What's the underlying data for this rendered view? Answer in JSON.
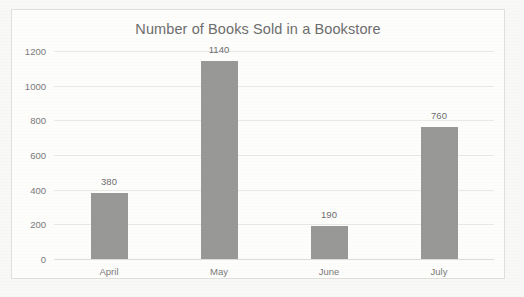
{
  "chart_data": {
    "type": "bar",
    "title": "Number of Books Sold in a Bookstore",
    "xlabel": "",
    "ylabel": "",
    "categories": [
      "April",
      "May",
      "June",
      "July"
    ],
    "values": [
      380,
      1140,
      190,
      760
    ],
    "value_labels": [
      "380",
      "1140",
      "190",
      "760"
    ],
    "ylim": [
      0,
      1200
    ],
    "yticks": [
      0,
      200,
      400,
      600,
      800,
      1000,
      1200
    ],
    "ytick_labels": [
      "0",
      "200",
      "400",
      "600",
      "800",
      "1000",
      "1200"
    ],
    "grid": true,
    "legend": false,
    "series": [
      {
        "name": "Books Sold",
        "values": [
          380,
          1140,
          190,
          760
        ],
        "color": "#989896"
      }
    ],
    "colors": {
      "bar": "#989896",
      "gridline": "#e9e9e7",
      "axis_text": "#7a7a7a",
      "title_text": "#6d6d6d",
      "plot_background": "#fdfdfc",
      "page_background": "#f8f8f6",
      "frame_border": "#e0e0de"
    }
  }
}
